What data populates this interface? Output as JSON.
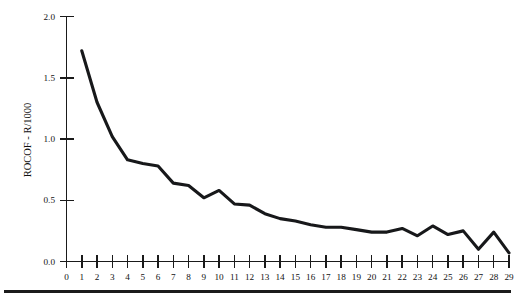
{
  "figure": {
    "background_color": "#ffffff",
    "line_color": "#17181a",
    "axis_color": "#1a1a1a",
    "bottom_rule": true
  },
  "axes": {
    "y_title": "ROCOF - R/1000",
    "x_title": "",
    "y_ticks": [
      "0.0",
      "0.5",
      "1.0",
      "1.5",
      "2.0"
    ],
    "x_ticks": [
      "0",
      "1",
      "2",
      "3",
      "4",
      "5",
      "6",
      "7",
      "8",
      "9",
      "10",
      "11",
      "12",
      "13",
      "14",
      "15",
      "16",
      "17",
      "18",
      "19",
      "20",
      "21",
      "22",
      "23",
      "24",
      "25",
      "26",
      "27",
      "28",
      "29"
    ]
  },
  "chart_data": {
    "type": "line",
    "title": "",
    "xlabel": "",
    "ylabel": "ROCOF - R/1000",
    "xlim": [
      0,
      29
    ],
    "ylim": [
      0.0,
      2.0
    ],
    "yticks": [
      0.0,
      0.5,
      1.0,
      1.5,
      2.0
    ],
    "xticks": [
      0,
      1,
      2,
      3,
      4,
      5,
      6,
      7,
      8,
      9,
      10,
      11,
      12,
      13,
      14,
      15,
      16,
      17,
      18,
      19,
      20,
      21,
      22,
      23,
      24,
      25,
      26,
      27,
      28,
      29
    ],
    "grid": false,
    "legend": false,
    "x": [
      1,
      2,
      3,
      4,
      5,
      6,
      7,
      8,
      9,
      10,
      11,
      12,
      13,
      14,
      15,
      16,
      17,
      18,
      19,
      20,
      21,
      22,
      23,
      24,
      25,
      26,
      27,
      28,
      29
    ],
    "series": [
      {
        "name": "ROCOF",
        "values": [
          1.72,
          1.3,
          1.02,
          0.83,
          0.8,
          0.78,
          0.64,
          0.62,
          0.52,
          0.58,
          0.47,
          0.46,
          0.39,
          0.35,
          0.33,
          0.3,
          0.28,
          0.28,
          0.26,
          0.24,
          0.24,
          0.27,
          0.21,
          0.29,
          0.22,
          0.25,
          0.1,
          0.24,
          0.07
        ]
      }
    ]
  }
}
